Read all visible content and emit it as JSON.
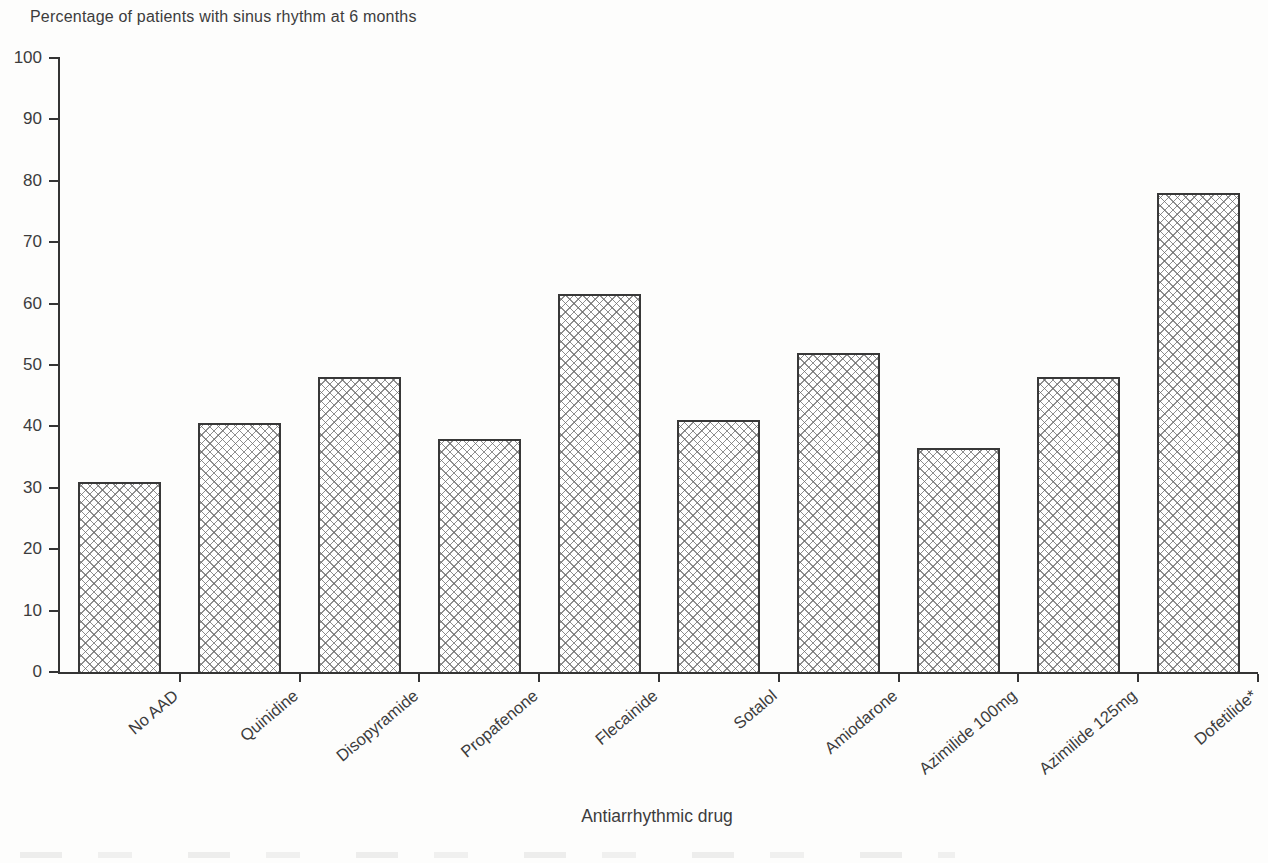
{
  "figure": {
    "background_color": "#fdfdfc",
    "axis_color": "#343434",
    "text_color": "#3c3c3c",
    "bar_style": "white fill with gray diagonal crosshatch pattern, dark outline"
  },
  "chart_data": {
    "type": "bar",
    "title": "Percentage of patients with sinus rhythm at 6 months",
    "xlabel": "Antiarrhythmic drug",
    "ylabel": "",
    "ylim": [
      0,
      100
    ],
    "yticks": [
      0,
      10,
      20,
      30,
      40,
      50,
      60,
      70,
      80,
      90,
      100
    ],
    "grid": false,
    "legend": null,
    "x_tick_label_rotation_deg": 40,
    "categories": [
      "No AAD",
      "Quinidine",
      "Disopyramide",
      "Propafenone",
      "Flecainide",
      "Sotalol",
      "Amiodarone",
      "Azimilide 100mg",
      "Azimilide 125mg",
      "Dofetilide*"
    ],
    "values": [
      31,
      40.5,
      48,
      38,
      61.5,
      41,
      52,
      36.5,
      48,
      78
    ]
  }
}
